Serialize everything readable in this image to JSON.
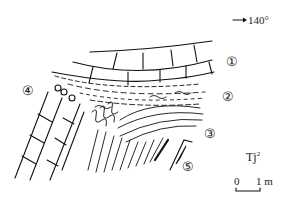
{
  "orientation": {
    "arrow_icon": "right-arrow-icon",
    "azimuth": "140°"
  },
  "layer_labels": [
    {
      "id": "1",
      "glyph": "①"
    },
    {
      "id": "2",
      "glyph": "②"
    },
    {
      "id": "3",
      "glyph": "③"
    },
    {
      "id": "4",
      "glyph": "④"
    },
    {
      "id": "5",
      "glyph": "⑤"
    }
  ],
  "formation": {
    "text": "Tj",
    "superscript": "2"
  },
  "scale_bar": {
    "start": "0",
    "end": "1 m"
  },
  "colors": {
    "ink": "#111111",
    "background": "#ffffff"
  }
}
